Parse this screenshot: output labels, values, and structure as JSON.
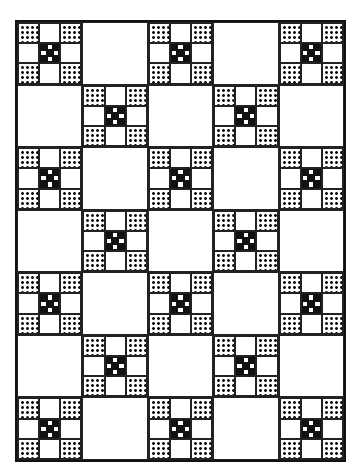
{
  "quilt": {
    "title": "",
    "rows": 7,
    "cols": 5,
    "layout": "checkerboard",
    "block_types": [
      "nine-patch",
      "plain"
    ],
    "nine_patch": {
      "corners": "dotted-print",
      "edges": "plain-white",
      "center": "mini-nine-patch"
    },
    "mini_nine_patch": [
      "B",
      "W",
      "B",
      "W",
      "B",
      "W",
      "B",
      "W",
      "B"
    ],
    "colors": {
      "ink": "#111111",
      "background": "#ffffff"
    }
  }
}
